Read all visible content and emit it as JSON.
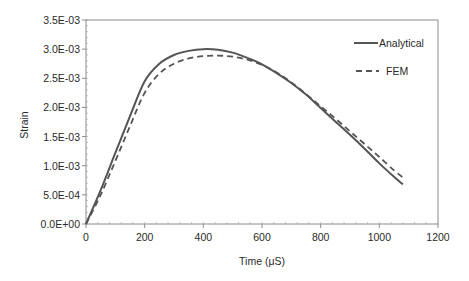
{
  "chart_data": {
    "type": "line",
    "title": "",
    "xlabel": "Time (μS)",
    "ylabel": "Strain",
    "xlim": [
      0,
      1200
    ],
    "ylim": [
      0,
      0.0035
    ],
    "x_ticks": [
      "0",
      "200",
      "400",
      "600",
      "800",
      "1000",
      "1200"
    ],
    "y_ticks": [
      "0.0E+00",
      "5.0E-04",
      "1.0E-03",
      "1.5E-03",
      "2.0E-03",
      "2.5E-03",
      "3.0E-03",
      "3.5E-03"
    ],
    "grid": false,
    "legend_position": "upper right",
    "series": [
      {
        "name": "Analytical",
        "style": "solid",
        "color": "#555555",
        "x": [
          0,
          50,
          100,
          150,
          200,
          250,
          300,
          350,
          400,
          450,
          500,
          550,
          600,
          650,
          700,
          750,
          800,
          850,
          900,
          950,
          1000,
          1050,
          1080
        ],
        "y": [
          0.0,
          0.00058,
          0.00122,
          0.00185,
          0.00245,
          0.00275,
          0.0029,
          0.00297,
          0.003,
          0.00299,
          0.00294,
          0.00285,
          0.00274,
          0.00259,
          0.00242,
          0.00222,
          0.00199,
          0.00176,
          0.00153,
          0.00129,
          0.00104,
          0.00081,
          0.00068
        ]
      },
      {
        "name": "FEM",
        "style": "dashed",
        "color": "#555555",
        "x": [
          0,
          50,
          100,
          150,
          200,
          250,
          300,
          350,
          400,
          450,
          500,
          550,
          600,
          650,
          700,
          750,
          800,
          850,
          900,
          950,
          1000,
          1050,
          1080
        ],
        "y": [
          0.0,
          0.0005,
          0.00108,
          0.00168,
          0.00225,
          0.00258,
          0.00275,
          0.00284,
          0.00288,
          0.00289,
          0.00287,
          0.00282,
          0.00273,
          0.0026,
          0.00243,
          0.00223,
          0.00202,
          0.00181,
          0.00159,
          0.00137,
          0.00115,
          0.00092,
          0.0008
        ]
      }
    ]
  }
}
